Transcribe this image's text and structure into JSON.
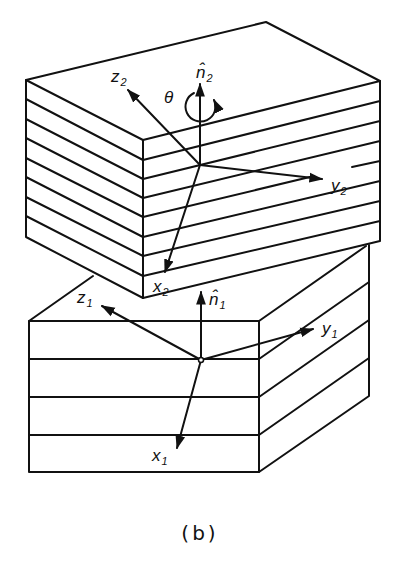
{
  "figure": {
    "caption": "(b)",
    "upper_block": {
      "layers": 8,
      "axes": {
        "x": {
          "label": "x",
          "subscript": "2"
        },
        "y": {
          "label": "y",
          "subscript": "2"
        },
        "z": {
          "label": "z",
          "subscript": "2"
        },
        "normal": {
          "label": "n̂",
          "subscript": "2"
        }
      },
      "rotation_label": "θ"
    },
    "lower_block": {
      "layers": 4,
      "axes": {
        "x": {
          "label": "x",
          "subscript": "1"
        },
        "y": {
          "label": "y",
          "subscript": "1"
        },
        "z": {
          "label": "z",
          "subscript": "1"
        },
        "normal": {
          "label": "n̂",
          "subscript": "1"
        }
      }
    }
  },
  "colors": {
    "line": "#111111",
    "background": "#ffffff"
  }
}
